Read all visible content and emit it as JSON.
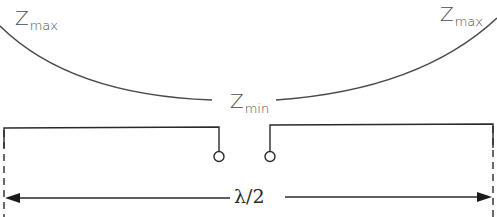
{
  "diagram": {
    "type": "half-wave dipole impedance distribution",
    "labels": {
      "z_max_left": {
        "main": "Z",
        "sub": "max"
      },
      "z_max_right": {
        "main": "Z",
        "sub": "max"
      },
      "z_min_center": {
        "main": "Z",
        "sub": "min"
      },
      "length": "λ/2"
    },
    "curve": {
      "description": "Impedance curve: maximum at both ends, minimum at center feed point",
      "color": "#4a4a4a"
    },
    "dipole": {
      "elements": [
        "left-element",
        "right-element"
      ],
      "feed_terminals": 2,
      "color": "#2a2a2a"
    },
    "dimension": {
      "label": "λ/2",
      "arrows": "both-ends",
      "boundary_lines": "dashed"
    }
  }
}
